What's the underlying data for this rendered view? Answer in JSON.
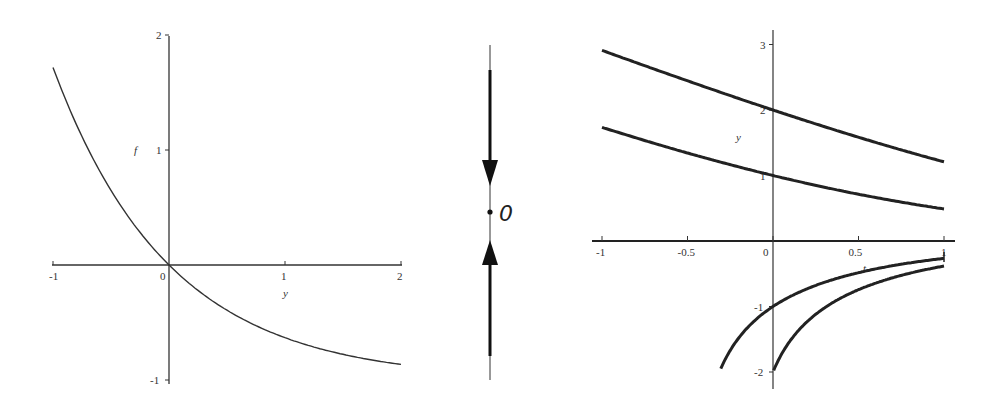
{
  "chart_data": [
    {
      "type": "line",
      "title": "",
      "xlabel": "y",
      "ylabel": "f",
      "xlim": [
        -1,
        2
      ],
      "ylim": [
        -1,
        2
      ],
      "x_ticks": [
        "-1",
        "0",
        "1",
        "2"
      ],
      "y_ticks": [
        "-1",
        "1",
        "2"
      ],
      "grid": false,
      "series": [
        {
          "name": "f(y) = e^(-y) - 1",
          "x": [
            -1,
            -0.75,
            -0.5,
            -0.25,
            0,
            0.25,
            0.5,
            0.75,
            1,
            1.25,
            1.5,
            1.75,
            2
          ],
          "values": [
            1.718,
            1.117,
            0.649,
            0.284,
            0,
            -0.221,
            -0.393,
            -0.528,
            -0.632,
            -0.713,
            -0.777,
            -0.826,
            -0.865
          ]
        }
      ]
    },
    {
      "type": "phase-line",
      "title": "",
      "equilibrium_label": "0",
      "equilibrium_value": 0,
      "stability": "stable",
      "arrows": [
        "down (above equilibrium)",
        "up (below equilibrium)"
      ]
    },
    {
      "type": "line",
      "title": "",
      "xlabel": "t",
      "ylabel": "y",
      "xlim": [
        -1,
        1
      ],
      "ylim": [
        -2,
        3
      ],
      "x_ticks": [
        "-1",
        "-0.5",
        "0",
        "0.5",
        "1"
      ],
      "y_ticks": [
        "-2",
        "-1",
        "1",
        "2",
        "3"
      ],
      "grid": false,
      "series": [
        {
          "name": "y(0)=2",
          "x": [
            -1,
            -0.5,
            0,
            0.5,
            1
          ],
          "values": [
            2.91,
            2.47,
            2.0,
            1.57,
            1.21
          ]
        },
        {
          "name": "y(0)=1",
          "x": [
            -1,
            -0.5,
            0,
            0.5,
            1
          ],
          "values": [
            1.75,
            1.39,
            1.0,
            0.72,
            0.49
          ]
        },
        {
          "name": "y(0)=-1",
          "x": [
            -0.3,
            -0.15,
            0,
            0.25,
            0.5,
            0.75,
            1
          ],
          "values": [
            -1.92,
            -1.41,
            -1.0,
            -0.65,
            -0.47,
            -0.35,
            -0.27
          ]
        },
        {
          "name": "y(0)=-2",
          "x": [
            0,
            0.1,
            0.25,
            0.5,
            0.75,
            1
          ],
          "values": [
            -2.0,
            -1.59,
            -1.17,
            -0.78,
            -0.55,
            -0.38
          ]
        }
      ]
    }
  ]
}
